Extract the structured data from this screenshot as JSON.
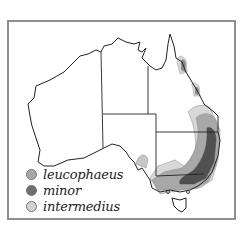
{
  "map": {
    "subject": "Australia distribution map",
    "frame_color": "#8f8f8f",
    "outline_color": "#222222"
  },
  "legend": {
    "items": [
      {
        "label": "leucophaeus",
        "color": "#a8a8a8"
      },
      {
        "label": "minor",
        "color": "#6e6e6e"
      },
      {
        "label": "intermedius",
        "color": "#d2d2d2"
      }
    ]
  }
}
